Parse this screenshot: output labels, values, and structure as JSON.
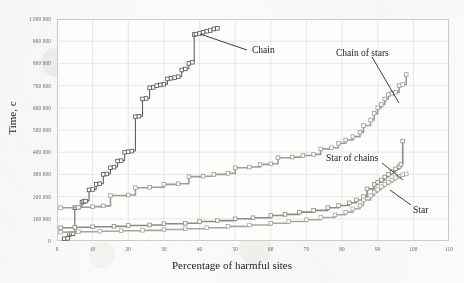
{
  "chart_data": {
    "type": "line",
    "title": "",
    "xlabel": "Percentage of harmful sites",
    "ylabel": "Time, c",
    "xlim": [
      0,
      110
    ],
    "ylim": [
      0,
      1000000
    ],
    "xticks": [
      0,
      10,
      20,
      30,
      40,
      50,
      60,
      70,
      80,
      90,
      100,
      110
    ],
    "xtick_labels": [
      "0",
      "10",
      "20",
      "30",
      "40",
      "50",
      "60",
      "70",
      "80",
      "90",
      "100",
      "110"
    ],
    "yticks": [
      0,
      100000,
      200000,
      300000,
      400000,
      500000,
      600000,
      700000,
      800000,
      900000,
      1000000
    ],
    "ytick_labels": [
      "0",
      "100 000",
      "200 000",
      "300 000",
      "400 000",
      "500 000",
      "600 000",
      "700 000",
      "800 000",
      "900 000",
      "1 000 000"
    ],
    "grid": true,
    "legend_position": "annotations",
    "marker": "square",
    "series": [
      {
        "name": "Chain",
        "color": "#55524e",
        "annotation": "Chain",
        "points": [
          [
            2,
            10000
          ],
          [
            3,
            12000
          ],
          [
            3.5,
            30000
          ],
          [
            4,
            32000
          ],
          [
            4.5,
            33000
          ],
          [
            5,
            150000
          ],
          [
            6,
            152000
          ],
          [
            7,
            175000
          ],
          [
            7.5,
            178000
          ],
          [
            8,
            180000
          ],
          [
            9,
            230000
          ],
          [
            10,
            232000
          ],
          [
            11,
            255000
          ],
          [
            12,
            258000
          ],
          [
            13,
            300000
          ],
          [
            14,
            302000
          ],
          [
            15,
            330000
          ],
          [
            16,
            333000
          ],
          [
            17,
            360000
          ],
          [
            18,
            362000
          ],
          [
            19,
            400000
          ],
          [
            20,
            402000
          ],
          [
            21,
            405000
          ],
          [
            22,
            560000
          ],
          [
            23,
            562000
          ],
          [
            24,
            640000
          ],
          [
            25,
            642000
          ],
          [
            26,
            690000
          ],
          [
            27,
            692000
          ],
          [
            28,
            700000
          ],
          [
            29,
            703000
          ],
          [
            30,
            706000
          ],
          [
            31,
            730000
          ],
          [
            32,
            733000
          ],
          [
            33,
            736000
          ],
          [
            34,
            740000
          ],
          [
            35,
            770000
          ],
          [
            36,
            775000
          ],
          [
            37,
            800000
          ],
          [
            38,
            805000
          ],
          [
            38.5,
            930000
          ],
          [
            39,
            932000
          ],
          [
            40,
            935000
          ],
          [
            41,
            940000
          ],
          [
            42,
            945000
          ],
          [
            43,
            948000
          ],
          [
            44,
            955000
          ],
          [
            45,
            958000
          ]
        ]
      },
      {
        "name": "Chain of stars",
        "color": "#9d9b94",
        "annotation": "Chain of stars",
        "points": [
          [
            1,
            150000
          ],
          [
            6,
            152000
          ],
          [
            10,
            155000
          ],
          [
            13,
            158000
          ],
          [
            15,
            205000
          ],
          [
            20,
            207000
          ],
          [
            22,
            240000
          ],
          [
            26,
            242000
          ],
          [
            30,
            255000
          ],
          [
            34,
            258000
          ],
          [
            37,
            290000
          ],
          [
            41,
            292000
          ],
          [
            44,
            300000
          ],
          [
            48,
            305000
          ],
          [
            50,
            330000
          ],
          [
            54,
            333000
          ],
          [
            57,
            345000
          ],
          [
            60,
            348000
          ],
          [
            62,
            375000
          ],
          [
            66,
            378000
          ],
          [
            69,
            385000
          ],
          [
            72,
            390000
          ],
          [
            74,
            415000
          ],
          [
            77,
            420000
          ],
          [
            79,
            440000
          ],
          [
            81,
            455000
          ],
          [
            83,
            470000
          ],
          [
            85,
            490000
          ],
          [
            86,
            520000
          ],
          [
            88,
            545000
          ],
          [
            89,
            575000
          ],
          [
            90,
            600000
          ],
          [
            91,
            615000
          ],
          [
            92,
            640000
          ],
          [
            93,
            660000
          ],
          [
            94,
            665000
          ],
          [
            95,
            670000
          ],
          [
            96,
            700000
          ],
          [
            97,
            705000
          ],
          [
            98,
            750000
          ]
        ]
      },
      {
        "name": "Star of chains",
        "color": "#8c8a83",
        "annotation": "Star of chains",
        "points": [
          [
            1,
            60000
          ],
          [
            5,
            62000
          ],
          [
            10,
            64000
          ],
          [
            16,
            66000
          ],
          [
            20,
            70000
          ],
          [
            26,
            72000
          ],
          [
            30,
            78000
          ],
          [
            36,
            80000
          ],
          [
            40,
            88000
          ],
          [
            45,
            92000
          ],
          [
            50,
            100000
          ],
          [
            55,
            105000
          ],
          [
            60,
            115000
          ],
          [
            64,
            120000
          ],
          [
            68,
            130000
          ],
          [
            72,
            138000
          ],
          [
            76,
            150000
          ],
          [
            79,
            160000
          ],
          [
            82,
            172000
          ],
          [
            84,
            185000
          ],
          [
            86,
            200000
          ],
          [
            87,
            235000
          ],
          [
            89,
            255000
          ],
          [
            90,
            265000
          ],
          [
            91,
            275000
          ],
          [
            92,
            288000
          ],
          [
            93,
            300000
          ],
          [
            94,
            312000
          ],
          [
            95,
            325000
          ],
          [
            96,
            335000
          ],
          [
            96.5,
            345000
          ],
          [
            97,
            450000
          ]
        ]
      },
      {
        "name": "Star",
        "color": "#a8a69f",
        "annotation": "Star",
        "points": [
          [
            1,
            40000
          ],
          [
            6,
            42000
          ],
          [
            12,
            44000
          ],
          [
            18,
            46000
          ],
          [
            24,
            48000
          ],
          [
            30,
            52000
          ],
          [
            36,
            55000
          ],
          [
            42,
            60000
          ],
          [
            48,
            66000
          ],
          [
            54,
            72000
          ],
          [
            60,
            80000
          ],
          [
            65,
            88000
          ],
          [
            70,
            96000
          ],
          [
            74,
            106000
          ],
          [
            78,
            118000
          ],
          [
            81,
            130000
          ],
          [
            83,
            145000
          ],
          [
            85,
            160000
          ],
          [
            86,
            185000
          ],
          [
            88,
            205000
          ],
          [
            89,
            220000
          ],
          [
            90,
            232000
          ],
          [
            91,
            245000
          ],
          [
            92,
            255000
          ],
          [
            93,
            265000
          ],
          [
            94,
            275000
          ],
          [
            95,
            285000
          ],
          [
            96,
            292000
          ],
          [
            97,
            298000
          ],
          [
            98,
            302000
          ]
        ]
      }
    ],
    "annotations": [
      {
        "label": "Chain",
        "label_x": 252,
        "label_y": 45,
        "leader": [
          247,
          50,
          200,
          34
        ]
      },
      {
        "label": "Chain of stars",
        "label_x": 336,
        "label_y": 48,
        "leader": [
          372,
          57,
          399,
          103
        ]
      },
      {
        "label": "Star of chains",
        "label_x": 326,
        "label_y": 153,
        "leader": [
          382,
          163,
          403,
          180
        ]
      },
      {
        "label": "Star",
        "label_x": 413,
        "label_y": 205,
        "leader": [
          411,
          205,
          390,
          190
        ]
      }
    ]
  }
}
